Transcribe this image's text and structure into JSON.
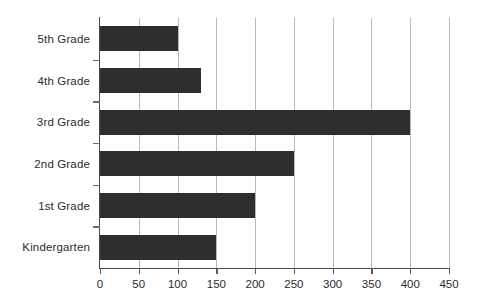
{
  "chart_data": {
    "type": "bar",
    "orientation": "horizontal",
    "title": "",
    "subtitle": "",
    "xlabel": "",
    "ylabel": "",
    "categories": [
      "5th Grade",
      "4th Grade",
      "3rd Grade",
      "2nd Grade",
      "1st Grade",
      "Kindergarten"
    ],
    "values": [
      100,
      130,
      400,
      250,
      200,
      150
    ],
    "xlim": [
      0,
      450
    ],
    "xticks": [
      0,
      50,
      100,
      150,
      200,
      250,
      300,
      350,
      400,
      450
    ],
    "xtick_labels": [
      "0",
      "50",
      "100",
      "150",
      "200",
      "250",
      "300",
      "350",
      "400",
      "450"
    ],
    "grid": "vertical",
    "legend": "none",
    "bar_color": "#2e2e2e",
    "gridline_color": "#b9b9b9",
    "axis_color": "#4a4a4a",
    "background_color": "#ffffff",
    "text_color": "#2b2b2b"
  }
}
